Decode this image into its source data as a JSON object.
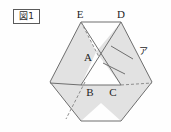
{
  "figure": {
    "caption": "図1",
    "caption_kanji": "図",
    "caption_number": "1"
  },
  "diagram": {
    "title": "図1",
    "labels": {
      "A": "A",
      "B": "B",
      "C": "C",
      "D": "D",
      "E": "E",
      "area_marker": "ア"
    },
    "label_positions": {
      "A": {
        "x": 88,
        "y": 58
      },
      "B": {
        "x": 90,
        "y": 94
      },
      "C": {
        "x": 113,
        "y": 94
      },
      "D": {
        "x": 121,
        "y": 18
      },
      "E": {
        "x": 80,
        "y": 18
      },
      "area_marker": {
        "x": 143,
        "y": 52
      }
    },
    "colors": {
      "shading": "#e2e2e2",
      "stroke": "#6e6e6e",
      "dashed_stroke": "#8d8d8d",
      "text": "#1f1f1f",
      "background": "#fefefe",
      "caption_border": "#5a5a5a"
    },
    "geometry": {
      "hexagon_vertices": [
        {
          "name": "top-left",
          "x": 81,
          "y": 22
        },
        {
          "name": "top-right",
          "x": 121,
          "y": 22
        },
        {
          "name": "right",
          "x": 152,
          "y": 82
        },
        {
          "name": "bottom-right",
          "x": 121,
          "y": 121
        },
        {
          "name": "bottom-left",
          "x": 81,
          "y": 121
        },
        {
          "name": "left",
          "x": 50,
          "y": 82
        }
      ],
      "triangle_abc": [
        {
          "name": "A",
          "x": 96,
          "y": 52
        },
        {
          "name": "B",
          "x": 81,
          "y": 85
        },
        {
          "name": "C",
          "x": 121,
          "y": 85
        }
      ],
      "middle_line_y": 85,
      "small_quad_marker": "ア"
    }
  }
}
